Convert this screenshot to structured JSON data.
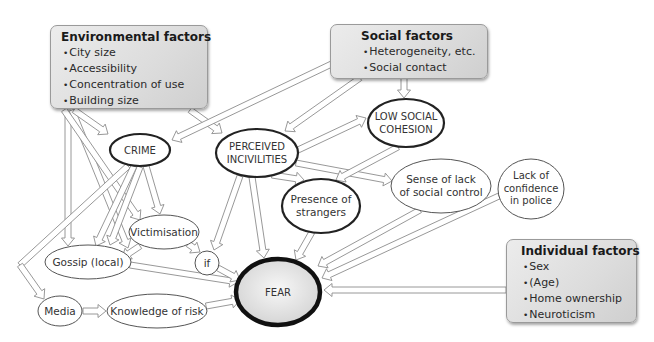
{
  "boxes": {
    "environmental": {
      "title": "Environmental factors",
      "items": [
        "City size",
        "Accessibility",
        "Concentration of use",
        "Building size"
      ]
    },
    "social": {
      "title": "Social factors",
      "items": [
        "Heterogeneity, etc.",
        "Social contact"
      ]
    },
    "individual": {
      "title": "Individual factors",
      "items": [
        "Sex",
        "(Age)",
        "Home ownership",
        "Neuroticism"
      ]
    }
  },
  "nodes": {
    "crime": {
      "line1": "CRIME"
    },
    "incivilities": {
      "line1": "PERCEIVED",
      "line2": "INCIVILITIES"
    },
    "cohesion": {
      "line1": "LOW SOCIAL",
      "line2": "COHESION"
    },
    "social_control": {
      "line1": "Sense of lack",
      "line2": "of social control"
    },
    "strangers": {
      "line1": "Presence of",
      "line2": "strangers"
    },
    "victimisation": {
      "line1": "Victimisation"
    },
    "gossip": {
      "line1": "Gossip (local)"
    },
    "if": {
      "line1": "if"
    },
    "fear": {
      "line1": "FEAR"
    },
    "police": {
      "line1": "Lack of",
      "line2": "confidence",
      "line3": "in police"
    },
    "media": {
      "line1": "Media"
    },
    "knowledge": {
      "line1": "Knowledge of risk"
    }
  },
  "colors": {
    "box_fill": "#dcdcdc",
    "box_border": "#9a9a9a",
    "arrow_stroke": "#8c8c8c",
    "ellipse_stroke": "#333333",
    "fear_fill": "#e6e6e6",
    "fear_stroke": "#111111"
  }
}
